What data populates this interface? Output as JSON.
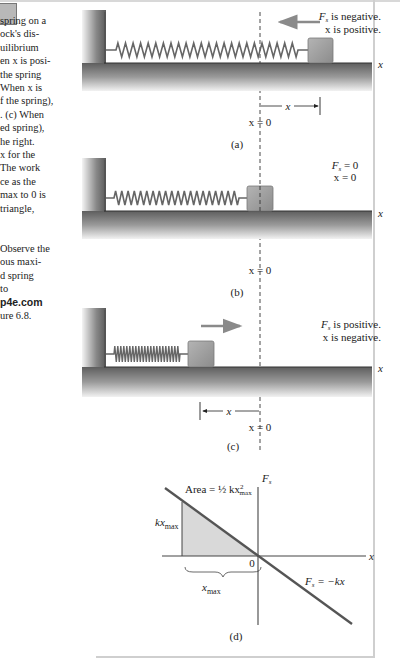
{
  "caption": {
    "lines": [
      "spring on a",
      "ock's dis-",
      "uilibrium",
      "en x is posi-",
      " the spring",
      "When x is",
      "f the spring),",
      ". (c) When",
      "ed spring),",
      "he right.",
      "x for the",
      "The work",
      "ce as the",
      "max to 0 is",
      "triangle,",
      "",
      "",
      "Observe the",
      "ous maxi-",
      "d spring",
      "to",
      "p4e.com",
      "ure 6.8."
    ]
  },
  "panels": {
    "a": {
      "label": "(a)",
      "force_text": "F",
      "force_sub": "s",
      "force_rest": " is negative.",
      "x_text": "x is positive.",
      "axis_label": "x",
      "origin_label": "x = 0",
      "disp_label": "x"
    },
    "b": {
      "label": "(b)",
      "force_text": "F",
      "force_sub": "s",
      "force_rest": " = 0",
      "x_text": "x = 0",
      "axis_label": "x",
      "origin_label": "x = 0"
    },
    "c": {
      "label": "(c)",
      "force_text": "F",
      "force_sub": "s",
      "force_rest": " is positive.",
      "x_text": "x is negative.",
      "axis_label": "x",
      "origin_label": "x = 0",
      "disp_label": "x"
    },
    "d": {
      "label": "(d)",
      "y_axis_label": "F",
      "y_axis_sub": "s",
      "x_axis_label": "x",
      "origin_label": "0",
      "area_label": "Area = ½ kx",
      "area_sup": "2",
      "area_sub": "max",
      "height_label": "kx",
      "height_sub": "max",
      "width_label": "x",
      "width_sub": "max",
      "line_label": "F",
      "line_sub": "s",
      "line_rest": " = −kx"
    }
  },
  "colors": {
    "arrow": "#8a8a8a",
    "block": "#a0a0a0",
    "wall": "#7a7a7a",
    "floor": "#6e6e6e",
    "line": "#555555",
    "shade": "#d9d9d9"
  }
}
